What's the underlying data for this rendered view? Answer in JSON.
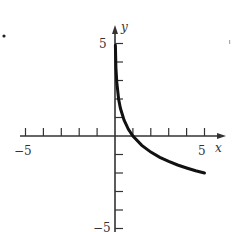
{
  "chart_data": {
    "type": "line",
    "title": "",
    "xlabel": "x",
    "ylabel": "y",
    "xlim": [
      -5,
      5
    ],
    "ylim": [
      -5,
      5
    ],
    "grid": false,
    "x_ticks": [
      -5,
      -4,
      -3,
      -2,
      -1,
      1,
      2,
      3,
      4,
      5
    ],
    "y_ticks": [
      -5,
      -4,
      -3,
      -2,
      -1,
      1,
      2,
      3,
      4,
      5
    ],
    "x_tick_labels": [
      {
        "value": -5,
        "label": "-5"
      },
      {
        "value": 5,
        "label": "5"
      }
    ],
    "y_tick_labels": [
      {
        "value": 5,
        "label": "5"
      },
      {
        "value": -5,
        "label": "-5"
      }
    ],
    "series": [
      {
        "name": "curve",
        "description": "decreasing logarithmic curve, vertical asymptote at x=0, x-intercept at x=1",
        "x": [
          0.02,
          0.05,
          0.1,
          0.2,
          0.3,
          0.5,
          0.75,
          1,
          1.5,
          2,
          2.5,
          3,
          3.5,
          4,
          4.5,
          5
        ],
        "y": [
          4.9,
          3.7,
          2.9,
          2.0,
          1.5,
          0.87,
          0.36,
          0,
          -0.51,
          -0.87,
          -1.15,
          -1.37,
          -1.57,
          -1.73,
          -1.88,
          -2.0
        ]
      }
    ],
    "color": "#111111"
  },
  "labels": {
    "x_axis": "x",
    "y_axis": "y",
    "x_min": "−5",
    "x_max": "5",
    "y_max": "5",
    "y_min": "−5"
  }
}
